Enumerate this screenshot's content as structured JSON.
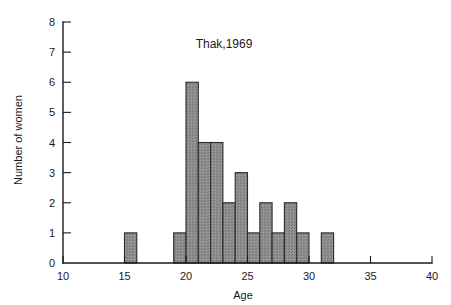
{
  "chart_data": {
    "type": "bar",
    "title": "Thak,1969",
    "xlabel": "Age",
    "ylabel": "Number of women",
    "xlim": [
      10,
      40
    ],
    "ylim": [
      0,
      8
    ],
    "xticks": [
      10,
      15,
      20,
      25,
      30,
      35,
      40
    ],
    "yticks": [
      0,
      1,
      2,
      3,
      4,
      5,
      6,
      7,
      8
    ],
    "xtick_labels": [
      "10",
      "15",
      "20",
      "25",
      "30",
      "35",
      "40"
    ],
    "ytick_labels": [
      "0",
      "1",
      "2",
      "3",
      "4",
      "5",
      "6",
      "7",
      "8"
    ],
    "grid": false,
    "legend": null,
    "bin_width": 1,
    "bins": [
      {
        "x0": 15,
        "x1": 16,
        "value": 1
      },
      {
        "x0": 19,
        "x1": 20,
        "value": 1
      },
      {
        "x0": 20,
        "x1": 21,
        "value": 6
      },
      {
        "x0": 21,
        "x1": 22,
        "value": 4
      },
      {
        "x0": 22,
        "x1": 23,
        "value": 4
      },
      {
        "x0": 23,
        "x1": 24,
        "value": 2
      },
      {
        "x0": 24,
        "x1": 25,
        "value": 3
      },
      {
        "x0": 25,
        "x1": 26,
        "value": 1
      },
      {
        "x0": 26,
        "x1": 27,
        "value": 2
      },
      {
        "x0": 27,
        "x1": 28,
        "value": 1
      },
      {
        "x0": 28,
        "x1": 29,
        "value": 2
      },
      {
        "x0": 29,
        "x1": 30,
        "value": 1
      },
      {
        "x0": 31,
        "x1": 32,
        "value": 1
      }
    ],
    "categories": [
      "15-16",
      "19-20",
      "20-21",
      "21-22",
      "22-23",
      "23-24",
      "24-25",
      "25-26",
      "26-27",
      "27-28",
      "28-29",
      "29-30",
      "31-32"
    ],
    "values": [
      1,
      6,
      4,
      4,
      2,
      3,
      1,
      2,
      1,
      2,
      1,
      1,
      1
    ],
    "colors": {
      "bar_fill": "#8c8c8c",
      "bar_edge": "#2b2b2b",
      "axis": "#1a1a1a",
      "background": "#ffffff"
    }
  },
  "figure": {
    "title_text": "Thak,1969",
    "x_axis_label": "Age",
    "y_axis_label": "Number of women"
  }
}
